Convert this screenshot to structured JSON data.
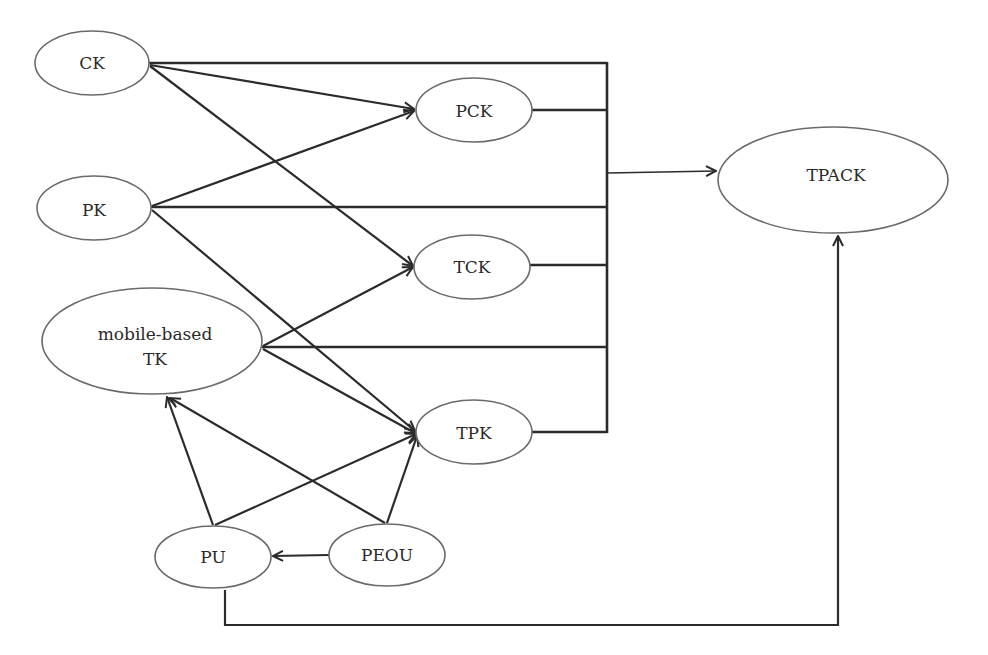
{
  "diagram": {
    "nodes": [
      {
        "id": "CK",
        "label": "CK",
        "cx": 92,
        "cy": 63,
        "rx": 57,
        "ry": 32
      },
      {
        "id": "PK",
        "label": "PK",
        "cx": 94,
        "cy": 208,
        "rx": 57,
        "ry": 32
      },
      {
        "id": "TK",
        "label": "mobile-based",
        "label2": "TK",
        "cx": 152,
        "cy": 341,
        "rx": 110,
        "ry": 53
      },
      {
        "id": "PU",
        "label": "PU",
        "cx": 213,
        "cy": 557,
        "rx": 58,
        "ry": 31
      },
      {
        "id": "PEOU",
        "label": "PEOU",
        "cx": 387,
        "cy": 555,
        "rx": 58,
        "ry": 31
      },
      {
        "id": "PCK",
        "label": "PCK",
        "cx": 474,
        "cy": 110,
        "rx": 58,
        "ry": 32
      },
      {
        "id": "TCK",
        "label": "TCK",
        "cx": 472,
        "cy": 267,
        "rx": 58,
        "ry": 32
      },
      {
        "id": "TPK",
        "label": "TPK",
        "cx": 474,
        "cy": 432,
        "rx": 58,
        "ry": 32
      },
      {
        "id": "TPACK",
        "label": "TPACK",
        "cx": 833,
        "cy": 180,
        "rx": 115,
        "ry": 53
      }
    ],
    "edges": [
      {
        "from": "CK",
        "to": "PCK",
        "arrow": true
      },
      {
        "from": "CK",
        "to": "TCK",
        "arrow": true
      },
      {
        "from": "PK",
        "to": "PCK",
        "arrow": true
      },
      {
        "from": "PK",
        "to": "TPK",
        "arrow": true
      },
      {
        "from": "TK",
        "to": "TCK",
        "arrow": true
      },
      {
        "from": "TK",
        "to": "TPK",
        "arrow": true
      },
      {
        "from": "PU",
        "to": "TK",
        "arrow": true
      },
      {
        "from": "PU",
        "to": "TPK",
        "arrow": true
      },
      {
        "from": "PEOU",
        "to": "TK",
        "arrow": true
      },
      {
        "from": "PEOU",
        "to": "TPK",
        "arrow": true
      },
      {
        "from": "PEOU",
        "to": "PU",
        "arrow": true
      },
      {
        "from": "bus",
        "to": "TPACK",
        "arrow": true
      },
      {
        "from": "PU",
        "to": "TPACK",
        "arrow": true,
        "routed": "orthogonal-below"
      }
    ],
    "bus_inputs": [
      "CK",
      "PCK",
      "PK",
      "TCK",
      "TK",
      "TPK"
    ]
  }
}
